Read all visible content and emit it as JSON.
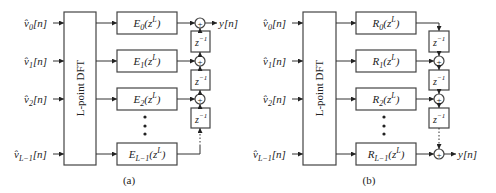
{
  "diagram_a": {
    "caption": "(a)",
    "dft_label": "L-point DFT",
    "inputs": [
      {
        "base": "v̂",
        "sub": "0",
        "suffix": "[n]"
      },
      {
        "base": "v̂",
        "sub": "1",
        "suffix": "[n]"
      },
      {
        "base": "v̂",
        "sub": "2",
        "suffix": "[n]"
      },
      {
        "base": "v̂",
        "sub": "L−1",
        "suffix": "[n]"
      }
    ],
    "filters": [
      {
        "name": "E",
        "sub": "0",
        "arg": "(z",
        "sup": "L",
        "close": ")"
      },
      {
        "name": "E",
        "sub": "1",
        "arg": "(z",
        "sup": "L",
        "close": ")"
      },
      {
        "name": "E",
        "sub": "2",
        "arg": "(z",
        "sup": "L",
        "close": ")"
      },
      {
        "name": "E",
        "sub": "L−1",
        "arg": "(z",
        "sup": "L",
        "close": ")"
      }
    ],
    "delay": {
      "base": "z",
      "sup": "−1"
    },
    "adder_symbol": "+",
    "output": "y[n]"
  },
  "diagram_b": {
    "caption": "(b)",
    "dft_label": "L-point DFT",
    "inputs": [
      {
        "base": "v̂",
        "sub": "0",
        "suffix": "[n]"
      },
      {
        "base": "v̂",
        "sub": "1",
        "suffix": "[n]"
      },
      {
        "base": "v̂",
        "sub": "2",
        "suffix": "[n]"
      },
      {
        "base": "v̂",
        "sub": "L−1",
        "suffix": "[n]"
      }
    ],
    "filters": [
      {
        "name": "R",
        "sub": "0",
        "arg": "(z",
        "sup": "L",
        "close": ")"
      },
      {
        "name": "R",
        "sub": "1",
        "arg": "(z",
        "sup": "L",
        "close": ")"
      },
      {
        "name": "R",
        "sub": "2",
        "arg": "(z",
        "sup": "L",
        "close": ")"
      },
      {
        "name": "R",
        "sub": "L−1",
        "arg": "(z",
        "sup": "L",
        "close": ")"
      }
    ],
    "delay": {
      "base": "z",
      "sup": "−1"
    },
    "adder_symbol": "+",
    "output": "y[n]"
  }
}
